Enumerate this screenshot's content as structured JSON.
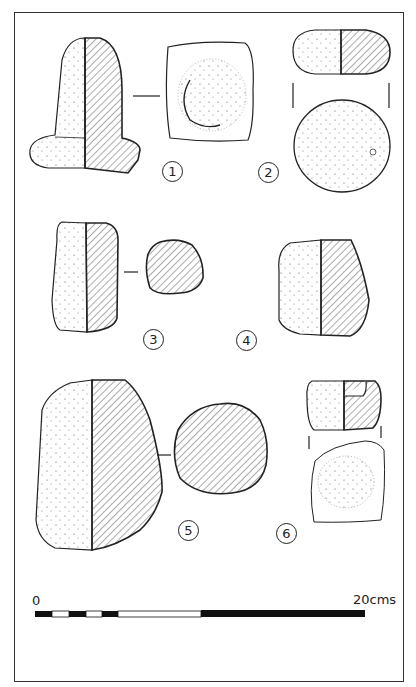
{
  "figure": {
    "objects": [
      {
        "number": "1",
        "views": [
          "side-elevation-with-section",
          "plan-view"
        ]
      },
      {
        "number": "2",
        "views": [
          "side-elevation-with-section",
          "plan-view"
        ]
      },
      {
        "number": "3",
        "views": [
          "side-elevation-with-section",
          "cross-section"
        ]
      },
      {
        "number": "4",
        "views": [
          "side-elevation-with-section"
        ]
      },
      {
        "number": "5",
        "views": [
          "side-elevation-with-section",
          "cross-section"
        ]
      },
      {
        "number": "6",
        "views": [
          "side-elevation-with-section",
          "plan-view"
        ]
      }
    ],
    "labels": {
      "n1": "1",
      "n2": "2",
      "n3": "3",
      "n4": "4",
      "n5": "5",
      "n6": "6"
    },
    "scale_bar": {
      "start_label": "0",
      "end_label": "20cms",
      "segments": [
        "black",
        "white",
        "black",
        "white",
        "black",
        "white",
        "black"
      ]
    },
    "colors": {
      "ink": "#222222",
      "hatch": "#444444",
      "paper": "#ffffff"
    }
  }
}
